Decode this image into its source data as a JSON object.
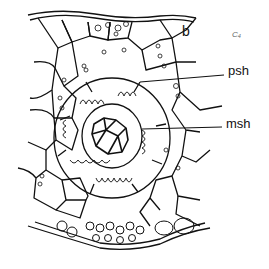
{
  "figure": {
    "panel_letter": "b",
    "corner_mark": "C₄",
    "labels": [
      {
        "id": "psh",
        "text": "psh",
        "meaning": "parenchyma sheath"
      },
      {
        "id": "msh",
        "text": "msh",
        "meaning": "mestome sheath"
      }
    ]
  },
  "colors": {
    "stroke": "#111111",
    "background": "#ffffff",
    "mark": "#666666"
  }
}
